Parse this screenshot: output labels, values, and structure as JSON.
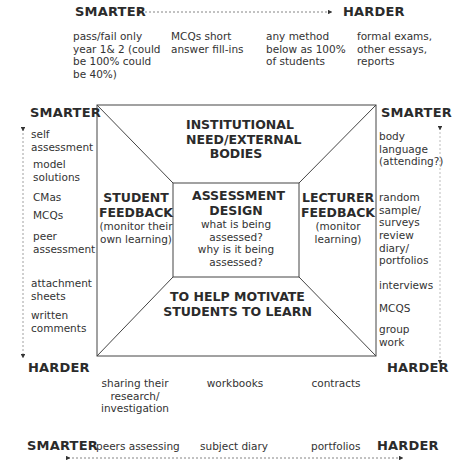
{
  "top_scale": {
    "left_label": "SMARTER",
    "right_label": "HARDER",
    "items": [
      "pass/fail only year 1& 2 (could be 100% could be 40%)",
      "MCQs short answer fill-ins",
      "any method below as 100% of students",
      "formal exams, other essays, reports"
    ]
  },
  "left_scale": {
    "top_label": "SMARTER",
    "bottom_label": "HARDER",
    "items": [
      "self assessment",
      "model solutions",
      "CMas",
      "MCQs",
      "peer assessment",
      "attachment sheets",
      "written comments"
    ]
  },
  "right_scale": {
    "top_label": "SMARTER",
    "bottom_label": "HARDER",
    "items": [
      "body language (attending?)",
      "random sample/ surveys",
      "review diary/ portfolios",
      "interviews",
      "MCQS",
      "group work"
    ]
  },
  "diagram": {
    "top": {
      "title": "INSTITUTIONAL NEED/EXTERNAL BODIES"
    },
    "left": {
      "title": "STUDENT FEEDBACK",
      "subtitle": "(monitor their own learning)"
    },
    "center": {
      "title": "ASSESSMENT DESIGN",
      "lines": [
        "what is being assessed?",
        "why is it being assessed?"
      ]
    },
    "right": {
      "title": "LECTURER FEEDBACK",
      "subtitle": "(monitor learning)"
    },
    "bottom": {
      "title": "TO HELP MOTIVATE STUDENTS TO LEARN"
    }
  },
  "below_box": {
    "items": [
      "sharing their research/ investigation",
      "workbooks",
      "contracts"
    ]
  },
  "bottom_scale": {
    "left_label": "SMARTER",
    "right_label": "HARDER",
    "items": [
      "peers assessing",
      "subject diary",
      "portfolios"
    ]
  }
}
